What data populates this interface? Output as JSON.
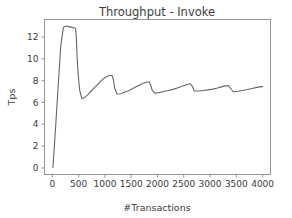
{
  "figure": {
    "background_color": "#ffffff",
    "width": 292,
    "height": 218
  },
  "chart_data": {
    "type": "line",
    "title": "Throughput - Invoke",
    "xlabel": "#Transactions",
    "ylabel": "Tps",
    "xlim": [
      -150,
      4150
    ],
    "ylim": [
      -0.6,
      13.6
    ],
    "grid": false,
    "legend": null,
    "line_color": "#666666",
    "line_width": 1.1,
    "xticks": [
      0,
      500,
      1000,
      1500,
      2000,
      2500,
      3000,
      3500,
      4000
    ],
    "xticklabels": [
      "0",
      "500",
      "1000",
      "1500",
      "2000",
      "2500",
      "3000",
      "3500",
      "4000"
    ],
    "yticks": [
      0,
      2,
      4,
      6,
      8,
      10,
      12
    ],
    "yticklabels": [
      "0",
      "2",
      "4",
      "6",
      "8",
      "10",
      "12"
    ],
    "series": [
      {
        "name": "Throughput",
        "x": [
          10,
          60,
          110,
          160,
          210,
          260,
          310,
          360,
          400,
          440,
          455,
          470,
          490,
          520,
          560,
          610,
          670,
          740,
          810,
          880,
          950,
          1010,
          1070,
          1110,
          1140,
          1165,
          1185,
          1230,
          1300,
          1380,
          1460,
          1540,
          1620,
          1700,
          1780,
          1840,
          1870,
          1900,
          1950,
          2030,
          2120,
          2210,
          2300,
          2390,
          2480,
          2560,
          2620,
          2660,
          2700,
          2780,
          2870,
          2960,
          3050,
          3140,
          3230,
          3300,
          3350,
          3390,
          3440,
          3530,
          3620,
          3710,
          3800,
          3890,
          3980,
          4000
        ],
        "y": [
          0.05,
          3.6,
          7.5,
          11.2,
          12.9,
          13.0,
          12.95,
          12.9,
          12.85,
          12.8,
          12.0,
          10.2,
          8.6,
          7.1,
          6.35,
          6.45,
          6.7,
          7.05,
          7.4,
          7.75,
          8.1,
          8.3,
          8.45,
          8.5,
          8.45,
          8.0,
          7.3,
          6.78,
          6.8,
          6.95,
          7.1,
          7.3,
          7.5,
          7.7,
          7.85,
          7.9,
          7.6,
          7.1,
          6.85,
          6.9,
          7.0,
          7.1,
          7.2,
          7.35,
          7.5,
          7.65,
          7.72,
          7.5,
          7.05,
          7.05,
          7.1,
          7.15,
          7.22,
          7.32,
          7.45,
          7.52,
          7.55,
          7.3,
          6.98,
          7.02,
          7.1,
          7.18,
          7.28,
          7.38,
          7.45,
          7.45
        ]
      }
    ],
    "annotations": []
  }
}
